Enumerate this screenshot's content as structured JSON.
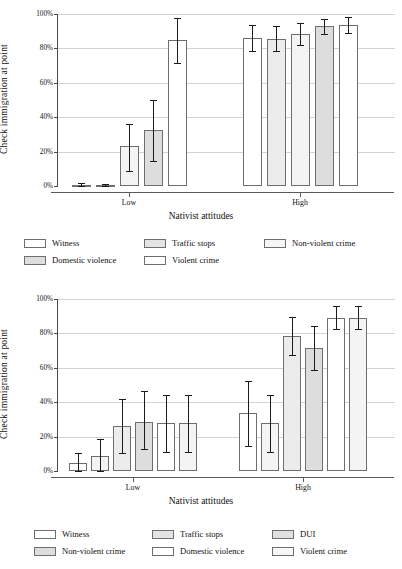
{
  "axis": {
    "ylabel": "Check immigration at point",
    "xlabel": "Nativist attitudes",
    "yticks": [
      "0%",
      "20%",
      "40%",
      "60%",
      "80%",
      "100%"
    ],
    "xticks": [
      "Low",
      "High"
    ]
  },
  "colors": {
    "bar_light": "#ffffff",
    "bar_pale": "#f4f4f4",
    "bar_shaded": "#dddddd",
    "bar_border": "#6e6e6e",
    "gridline": "#d2d2d2",
    "axis": "#4a4a4a",
    "error": "#1b1b1b"
  },
  "chart_data": [
    {
      "type": "bar",
      "title": "",
      "xlabel": "Nativist attitudes",
      "ylabel": "Check immigration at point",
      "ylim": [
        0,
        100
      ],
      "yticks": [
        0,
        20,
        40,
        60,
        80,
        100
      ],
      "grid": true,
      "legend_position": "bottom",
      "categories": [
        "Low",
        "High"
      ],
      "series": [
        {
          "name": "Witness",
          "fill": "#ffffff",
          "values": [
            0.7,
            85.8
          ],
          "ci_low": [
            0.0,
            78.2
          ],
          "ci_high": [
            1.5,
            93.6
          ]
        },
        {
          "name": "Traffic stops",
          "fill": "#ececec",
          "values": [
            0.6,
            85.6
          ],
          "ci_low": [
            0.0,
            78.2
          ],
          "ci_high": [
            1.4,
            93.2
          ]
        },
        {
          "name": "Non-violent crime",
          "fill": "#f4f4f4",
          "values": [
            23.0,
            88.4
          ],
          "ci_low": [
            9.0,
            82.2
          ],
          "ci_high": [
            36.0,
            94.5
          ]
        },
        {
          "name": "Domestic violence",
          "fill": "#dddddd",
          "values": [
            32.4,
            92.8
          ],
          "ci_low": [
            14.8,
            88.6
          ],
          "ci_high": [
            50.2,
            97.0
          ]
        },
        {
          "name": "Violent crime",
          "fill": "#ffffff",
          "values": [
            84.6,
            93.6
          ],
          "ci_low": [
            71.6,
            88.8
          ],
          "ci_high": [
            97.6,
            98.2
          ]
        }
      ]
    },
    {
      "type": "bar",
      "title": "",
      "xlabel": "Nativist attitudes",
      "ylabel": "Check immigration at point",
      "ylim": [
        0,
        100
      ],
      "yticks": [
        0,
        20,
        40,
        60,
        80,
        100
      ],
      "grid": true,
      "legend_position": "bottom",
      "categories": [
        "Low",
        "High"
      ],
      "series": [
        {
          "name": "Witness",
          "fill": "#ffffff",
          "values": [
            4.6,
            33.8
          ],
          "ci_low": [
            -0.8,
            14.8
          ],
          "ci_high": [
            10.2,
            52.4
          ]
        },
        {
          "name": "Traffic stops",
          "fill": "#f4f4f4",
          "values": [
            8.8,
            27.8
          ],
          "ci_low": [
            0.0,
            11.2
          ],
          "ci_high": [
            18.4,
            44.2
          ]
        },
        {
          "name": "DUI",
          "fill": "#ececec",
          "values": [
            26.2,
            78.4
          ],
          "ci_low": [
            10.4,
            67.4
          ],
          "ci_high": [
            41.6,
            89.4
          ]
        },
        {
          "name": "Non-violent crime",
          "fill": "#dddddd",
          "values": [
            28.4,
            71.8
          ],
          "ci_low": [
            12.6,
            58.8
          ],
          "ci_high": [
            46.8,
            84.2
          ]
        },
        {
          "name": "Domestic violence",
          "fill": "#ffffff",
          "values": [
            27.8,
            89.0
          ],
          "ci_low": [
            11.2,
            82.4
          ],
          "ci_high": [
            44.0,
            96.2
          ]
        },
        {
          "name": "Violent crime",
          "fill": "#f4f4f4",
          "values": [
            27.8,
            89.0
          ],
          "ci_low": [
            11.2,
            82.4
          ],
          "ci_high": [
            44.2,
            95.8
          ]
        }
      ]
    }
  ],
  "figure1": {
    "legend": [
      {
        "label": "Witness",
        "swatch": "#ffffff"
      },
      {
        "label": "Domestic violence",
        "swatch": "#dddddd"
      },
      {
        "label": "Traffic stops",
        "swatch": "#e4e4e4"
      },
      {
        "label": "Violent crime",
        "swatch": "#ffffff"
      },
      {
        "label": "Non-violent crime",
        "swatch": "#f6f6f6"
      }
    ]
  },
  "figure2": {
    "legend": [
      {
        "label": "Witness",
        "swatch": "#ffffff"
      },
      {
        "label": "Non-violent crime",
        "swatch": "#dddddd"
      },
      {
        "label": "Traffic stops",
        "swatch": "#e4e4e4"
      },
      {
        "label": "Domestic violence",
        "swatch": "#ffffff"
      },
      {
        "label": "DUI",
        "swatch": "#e0e0e0"
      },
      {
        "label": "Violent crime",
        "swatch": "#f6f6f6"
      }
    ]
  }
}
